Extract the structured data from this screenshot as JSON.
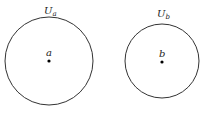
{
  "diagram": {
    "sets": [
      {
        "label_main": "U",
        "label_sub": "a",
        "point": "a",
        "cx": 49,
        "cy": 61,
        "r": 44
      },
      {
        "label_main": "U",
        "label_sub": "b",
        "point": "b",
        "cx": 162,
        "cy": 61,
        "r": 37
      }
    ],
    "colors": {
      "stroke": "#333333",
      "point": "#000000"
    }
  }
}
